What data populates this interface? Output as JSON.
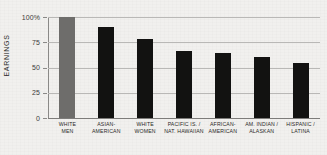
{
  "chart_data": {
    "type": "bar",
    "title": "",
    "subtitle": "",
    "xlabel": "",
    "ylabel": "EARNINGS",
    "ylim": [
      0,
      100
    ],
    "grid": true,
    "legend": "none",
    "categories": [
      "WHITE MEN",
      "ASIAN-AMERICAN",
      "WHITE WOMEN",
      "PACIFIC IS. / NAT. HAWAIIAN",
      "AFRICAN-AMERICAN",
      "AM. INDIAN / ALASKAN",
      "HISPANIC / LATINA"
    ],
    "category_lines": [
      [
        "WHITE",
        "MEN"
      ],
      [
        "ASIAN-",
        "AMERICAN"
      ],
      [
        "WHITE",
        "WOMEN"
      ],
      [
        "PACIFIC IS. /",
        "NAT. HAWAIIAN"
      ],
      [
        "AFRICAN-",
        "AMERICAN"
      ],
      [
        "AM. INDIAN /",
        "ALASKAN"
      ],
      [
        "HISPANIC /",
        "LATINA"
      ]
    ],
    "values": [
      100,
      90,
      78,
      66,
      64,
      60,
      54
    ],
    "bar_colors": [
      "#6e6d6b",
      "#121211",
      "#121211",
      "#121211",
      "#121211",
      "#121211",
      "#121211"
    ],
    "highlight_index": 0,
    "y_ticks": [
      {
        "value": 100,
        "label": "100%"
      },
      {
        "value": 75,
        "label": "75"
      },
      {
        "value": 50,
        "label": "50"
      },
      {
        "value": 25,
        "label": "25"
      },
      {
        "value": 0,
        "label": "0"
      }
    ],
    "colors": {
      "background": "#f1f0ee",
      "bar": "#121211",
      "bar_highlight": "#6e6d6b",
      "gridline": "#b9b8b6",
      "axis": "#8a8987",
      "text": "#2a2927"
    }
  }
}
